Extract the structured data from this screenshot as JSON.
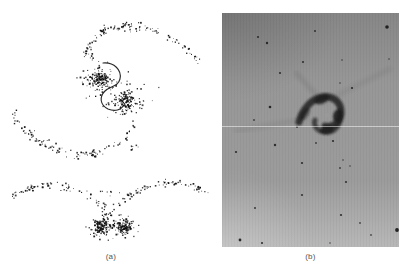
{
  "figure": {
    "panel_a": {
      "label": "(a)",
      "content": "simulation scatter plot of interacting galaxy pair, face-on view with orbit curve and edge-on view",
      "dot_color": "#0d0d0d",
      "orbit_color": "#111111",
      "orbit_path": "M 103,63 C 114,62 122,70 120,79 C 118,87 110,86 105,91 C 99,97 100,105 108,109 C 115,112 121,110 124,105",
      "seed": 7,
      "clusters": [
        {
          "cx": 100,
          "cy": 80,
          "n": 125,
          "sx": 5,
          "sy": 5
        },
        {
          "cx": 100,
          "cy": 80,
          "n": 40,
          "sx": 11,
          "sy": 10
        },
        {
          "cx": 126,
          "cy": 101,
          "n": 125,
          "sx": 5,
          "sy": 5
        },
        {
          "cx": 126,
          "cy": 101,
          "n": 40,
          "sx": 11,
          "sy": 10
        },
        {
          "cx": 104,
          "cy": 31,
          "n": 13,
          "sx": 2.5,
          "sy": 1.8
        },
        {
          "cx": 126,
          "cy": 27,
          "n": 9,
          "sx": 2.5,
          "sy": 1.5
        },
        {
          "cx": 90,
          "cy": 56,
          "n": 7,
          "sx": 3,
          "sy": 4
        },
        {
          "cx": 93,
          "cy": 154,
          "n": 8,
          "sx": 3,
          "sy": 1.5
        },
        {
          "cx": 133,
          "cy": 147,
          "n": 8,
          "sx": 3.5,
          "sy": 2
        },
        {
          "cx": 31,
          "cy": 134,
          "n": 7,
          "sx": 2.5,
          "sy": 2
        },
        {
          "cx": 108,
          "cy": 194,
          "n": 8,
          "sx": 6,
          "sy": 2.5
        },
        {
          "cx": 33,
          "cy": 188,
          "n": 8,
          "sx": 3,
          "sy": 1.5
        },
        {
          "cx": 170,
          "cy": 184,
          "n": 8,
          "sx": 3.5,
          "sy": 1.5
        },
        {
          "cx": 109,
          "cy": 214,
          "n": 10,
          "sx": 3,
          "sy": 3
        },
        {
          "cx": 102,
          "cy": 227,
          "n": 105,
          "sx": 4.5,
          "sy": 4
        },
        {
          "cx": 124,
          "cy": 227,
          "n": 105,
          "sx": 4.5,
          "sy": 4
        },
        {
          "cx": 102,
          "cy": 227,
          "n": 35,
          "sx": 9,
          "sy": 5.5
        },
        {
          "cx": 124,
          "cy": 227,
          "n": 35,
          "sx": 9,
          "sy": 5.5
        }
      ],
      "tails": [
        {
          "pts": [
            [
              83,
              58
            ],
            [
              89,
              47
            ],
            [
              97,
              38
            ],
            [
              106,
              32
            ],
            [
              117,
              28
            ],
            [
              130,
              26
            ],
            [
              145,
              27
            ],
            [
              160,
              32
            ],
            [
              175,
              40
            ],
            [
              188,
              50
            ],
            [
              197,
              60
            ],
            [
              200,
              68
            ]
          ],
          "n": 95,
          "jitter": 2.0
        },
        {
          "pts": [
            [
              138,
              118
            ],
            [
              134,
              129
            ],
            [
              126,
              139
            ],
            [
              113,
              147
            ],
            [
              97,
              153
            ],
            [
              77,
              154
            ],
            [
              57,
              149
            ],
            [
              39,
              141
            ],
            [
              25,
              130
            ],
            [
              17,
              119
            ],
            [
              14,
              109
            ]
          ],
          "n": 100,
          "jitter": 2.0
        },
        {
          "pts": [
            [
              15,
              197
            ],
            [
              25,
              191
            ],
            [
              38,
              186
            ],
            [
              52,
              184
            ],
            [
              66,
              186
            ],
            [
              80,
              192
            ],
            [
              93,
              199
            ],
            [
              105,
              207
            ]
          ],
          "n": 65,
          "jitter": 1.6
        },
        {
          "pts": [
            [
              113,
              207
            ],
            [
              123,
              200
            ],
            [
              136,
              192
            ],
            [
              151,
              186
            ],
            [
              166,
              183
            ],
            [
              181,
              184
            ],
            [
              194,
              187
            ],
            [
              206,
              192
            ]
          ],
          "n": 65,
          "jitter": 1.6
        }
      ]
    },
    "panel_b": {
      "label": "(b)",
      "content": "photographic negative of interacting galaxy pair with field stars and plate seam",
      "width": 177,
      "height": 234,
      "colors": {
        "top": "#878787",
        "mid": "#979797",
        "mid2": "#9c9c9c",
        "bottom": "#b8b8b8",
        "star": "#1a1a1a",
        "merger": "#1c1c1c",
        "seam": "#ffffff"
      },
      "seam_y": 113,
      "stars": [
        [
          165,
          14,
          1.8,
          0.95
        ],
        [
          93,
          18,
          1.0,
          0.8
        ],
        [
          36,
          24,
          1.1,
          0.8
        ],
        [
          45,
          30,
          1.2,
          0.85
        ],
        [
          81,
          49,
          1.1,
          0.8
        ],
        [
          120,
          47,
          0.8,
          0.7
        ],
        [
          58,
          60,
          1.1,
          0.8
        ],
        [
          130,
          75,
          1.1,
          0.85
        ],
        [
          118,
          70,
          0.8,
          0.7
        ],
        [
          48,
          94,
          1.3,
          0.9
        ],
        [
          32,
          107,
          0.9,
          0.75
        ],
        [
          167,
          46,
          0.8,
          0.7
        ],
        [
          14,
          139,
          1.1,
          0.85
        ],
        [
          53,
          132,
          1.2,
          0.85
        ],
        [
          80,
          150,
          1.1,
          0.85
        ],
        [
          118,
          155,
          0.9,
          0.75
        ],
        [
          124,
          169,
          1.1,
          0.8
        ],
        [
          80,
          182,
          1.1,
          0.8
        ],
        [
          33,
          195,
          1.0,
          0.8
        ],
        [
          119,
          202,
          1.1,
          0.85
        ],
        [
          138,
          210,
          0.9,
          0.7
        ],
        [
          175,
          217,
          1.9,
          0.95
        ],
        [
          18,
          227,
          1.4,
          0.9
        ],
        [
          40,
          230,
          1.1,
          0.85
        ],
        [
          108,
          230,
          0.8,
          0.7
        ],
        [
          149,
          222,
          0.9,
          0.7
        ],
        [
          75,
          114,
          0.9,
          0.8
        ],
        [
          111,
          128,
          1.1,
          0.85
        ],
        [
          94,
          130,
          0.9,
          0.75
        ],
        [
          121,
          147,
          0.8,
          0.7
        ],
        [
          128,
          153,
          0.8,
          0.7
        ]
      ],
      "fuzzy_star": {
        "x": 146,
        "y": 139,
        "r": 6
      },
      "merger": {
        "strokes": [
          {
            "d": "M 77,109 C 80,97 89,86 100,84 C 112,82 120,90 119,101 C 118,110 110,115 103,113",
            "w": 7,
            "o": 0.8
          },
          {
            "d": "M 118,98 C 121,110 113,121 102,119 C 95,118 91,112 93,107",
            "w": 5,
            "o": 0.7
          }
        ],
        "blobs": [
          {
            "cx": 100,
            "cy": 86,
            "rx": 8,
            "ry": 4.5,
            "rot": -25,
            "o": 0.85
          },
          {
            "cx": 116,
            "cy": 103,
            "rx": 5,
            "ry": 6.5,
            "rot": 10,
            "o": 0.9
          },
          {
            "cx": 105,
            "cy": 117,
            "rx": 7,
            "ry": 4,
            "rot": -10,
            "o": 0.85
          },
          {
            "cx": 83,
            "cy": 101,
            "rx": 7,
            "ry": 3.5,
            "rot": -55,
            "o": 0.55
          }
        ],
        "hole": {
          "x": 105,
          "y": 102,
          "r": 2.6
        }
      },
      "streaks": [
        {
          "x1": 96,
          "y1": 84,
          "x2": 74,
          "y2": 60,
          "w": 4,
          "o": 0.1
        },
        {
          "x1": 100,
          "y1": 90,
          "x2": 168,
          "y2": 56,
          "w": 4,
          "o": 0.07
        },
        {
          "x1": 84,
          "y1": 106,
          "x2": 14,
          "y2": 118,
          "w": 4,
          "o": 0.07
        }
      ]
    }
  }
}
